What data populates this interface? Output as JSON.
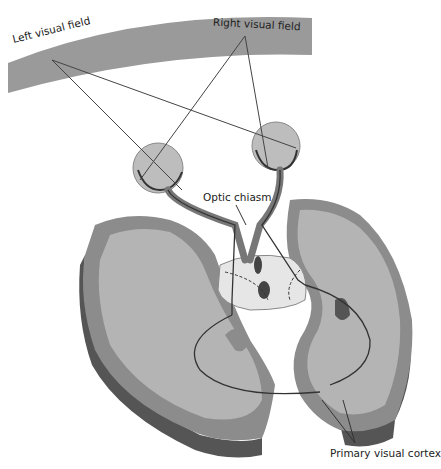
{
  "diagram": {
    "labels": {
      "left_visual_field": "Left visual field",
      "right_visual_field": "Right visual field",
      "optic_chiasm": "Optic chiasm",
      "primary_visual_cortex": "Primary visual cortex"
    },
    "colors": {
      "background": "#ffffff",
      "visual_field_band": "#9a9a9a",
      "grey_matter": "#8c8c8c",
      "white_matter": "#b4b4b4",
      "cortex_side": "#5a5a5a",
      "eyeball": "#c8c8c8",
      "pathway_line": "#333333",
      "thalamus": "#e6e6e6"
    },
    "components": [
      "visual-field-arc",
      "left-eye",
      "right-eye",
      "optic-nerves",
      "optic-chiasm",
      "lateral-geniculate-nuclei",
      "optic-radiations",
      "left-hemisphere",
      "right-hemisphere",
      "primary-visual-cortex"
    ]
  }
}
